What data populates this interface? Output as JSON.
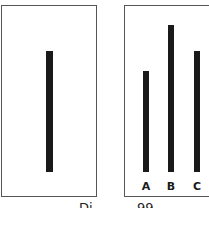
{
  "diagram": {
    "reference_panel": {
      "line": {
        "length_px": 121
      }
    },
    "comparison_panel": {
      "lines": [
        {
          "label": "A",
          "length_px": 101
        },
        {
          "label": "B",
          "length_px": 147
        },
        {
          "label": "C",
          "length_px": 121
        }
      ]
    },
    "caption": {
      "part1": "Di",
      "part2": "99"
    },
    "colors": {
      "line": "#1a1a1a",
      "border": "#555555",
      "background": "#ffffff"
    }
  }
}
